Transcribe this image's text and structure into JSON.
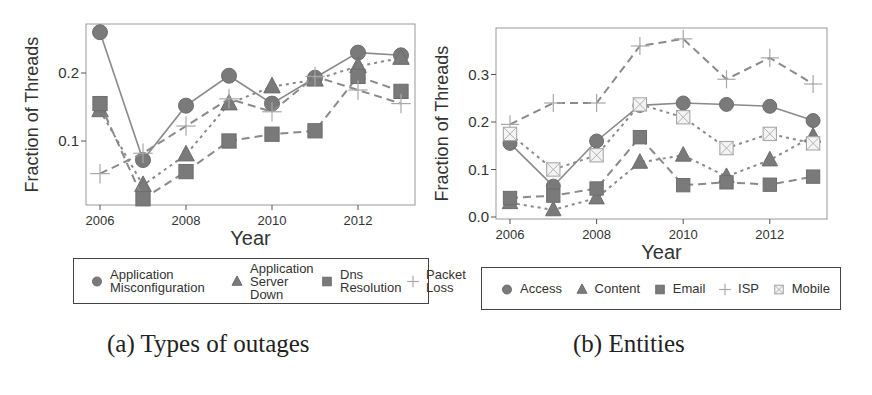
{
  "chart_data": [
    {
      "id": "a",
      "type": "line",
      "title": "",
      "caption": "(a) Types of outages",
      "xlabel": "Year",
      "ylabel": "Fraction of Threads",
      "x": [
        2006,
        2007,
        2008,
        2009,
        2010,
        2011,
        2012,
        2013
      ],
      "xticks": [
        2006,
        2008,
        2010,
        2012
      ],
      "yticks": [
        0.1,
        0.2
      ],
      "ylim": [
        0.01,
        0.265
      ],
      "xlim": [
        2005.7,
        2013.3
      ],
      "grid": false,
      "legend_position": "bottom",
      "series": [
        {
          "name": "Application Misconfiguration",
          "marker": "circle",
          "line": "solid",
          "values": [
            0.26,
            0.072,
            0.152,
            0.196,
            0.155,
            0.193,
            0.23,
            0.226
          ]
        },
        {
          "name": "Application Server Down",
          "marker": "triangle",
          "line": "dotted",
          "values": [
            0.145,
            0.035,
            0.08,
            0.155,
            0.18,
            0.19,
            0.21,
            0.222
          ]
        },
        {
          "name": "Dns Resolution",
          "marker": "square",
          "line": "dashed",
          "values": [
            0.155,
            0.015,
            0.055,
            0.1,
            0.11,
            0.115,
            0.195,
            0.173
          ]
        },
        {
          "name": "Packet Loss",
          "marker": "plus",
          "line": "dashed",
          "values": [
            0.052,
            0.082,
            0.122,
            0.162,
            0.143,
            0.195,
            0.175,
            0.155
          ]
        }
      ]
    },
    {
      "id": "b",
      "type": "line",
      "title": "",
      "caption": "(b) Entities",
      "xlabel": "Year",
      "ylabel": "Fraction of Threads",
      "x": [
        2006,
        2007,
        2008,
        2009,
        2010,
        2011,
        2012,
        2013
      ],
      "xticks": [
        2006,
        2008,
        2010,
        2012
      ],
      "yticks": [
        0.0,
        0.1,
        0.2,
        0.3
      ],
      "ylim": [
        -0.005,
        0.4
      ],
      "xlim": [
        2005.6,
        2013.3
      ],
      "grid": false,
      "legend_position": "bottom",
      "series": [
        {
          "name": "Access",
          "marker": "circle",
          "line": "solid",
          "values": [
            0.155,
            0.065,
            0.16,
            0.235,
            0.24,
            0.237,
            0.233,
            0.203
          ]
        },
        {
          "name": "Content",
          "marker": "triangle",
          "line": "dotted",
          "values": [
            0.03,
            0.015,
            0.04,
            0.115,
            0.13,
            0.085,
            0.12,
            0.17
          ]
        },
        {
          "name": "Email",
          "marker": "square",
          "line": "dashed",
          "values": [
            0.04,
            0.045,
            0.06,
            0.168,
            0.067,
            0.073,
            0.068,
            0.085
          ]
        },
        {
          "name": "ISP",
          "marker": "plus",
          "line": "dashed",
          "values": [
            0.195,
            0.24,
            0.24,
            0.36,
            0.375,
            0.29,
            0.335,
            0.28
          ]
        },
        {
          "name": "Mobile",
          "marker": "boxed-x",
          "line": "dotted",
          "values": [
            0.175,
            0.1,
            0.13,
            0.237,
            0.21,
            0.145,
            0.175,
            0.155
          ]
        }
      ]
    }
  ],
  "panels": {
    "a": {
      "caption": "(a) Types of outages",
      "xlabel": "Year",
      "ylabel": "Fraction of Threads",
      "legend": [
        {
          "label": "Application Misconfiguration",
          "marker": "circle-icon"
        },
        {
          "label": "Application Server Down",
          "marker": "triangle-icon"
        },
        {
          "label": "Dns Resolution",
          "marker": "square-icon"
        },
        {
          "label": "Packet Loss",
          "marker": "plus-icon"
        }
      ]
    },
    "b": {
      "caption": "(b) Entities",
      "xlabel": "Year",
      "ylabel": "Fraction of Threads",
      "legend": [
        {
          "label": "Access",
          "marker": "circle-icon"
        },
        {
          "label": "Content",
          "marker": "triangle-icon"
        },
        {
          "label": "Email",
          "marker": "square-icon"
        },
        {
          "label": "ISP",
          "marker": "plus-icon"
        },
        {
          "label": "Mobile",
          "marker": "boxed-x-icon"
        }
      ]
    }
  },
  "colors": {
    "marker_fill": "#7a7a7a",
    "marker_light": "#a8a8a8",
    "line": "#8a8a8a",
    "axis": "#555555",
    "text": "#333333"
  }
}
